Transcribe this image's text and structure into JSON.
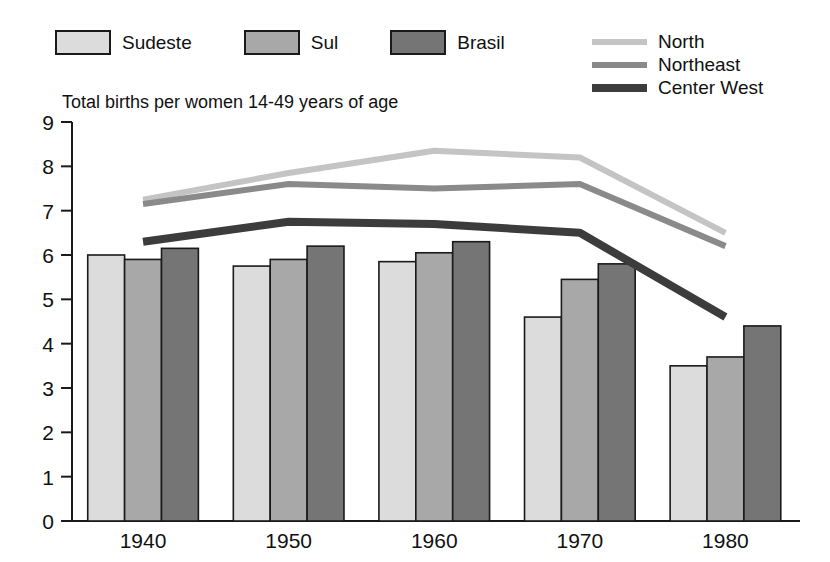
{
  "chart_data": {
    "type": "bar",
    "title": "Total births per women 14-49 years of age",
    "xlabel": "",
    "ylabel": "",
    "ylim": [
      0,
      9
    ],
    "ytick_values": [
      0,
      1,
      2,
      3,
      4,
      5,
      6,
      7,
      8,
      9
    ],
    "ytick_labels": [
      "0",
      "1",
      "2",
      "3",
      "4",
      "5",
      "6",
      "7",
      "8",
      "9"
    ],
    "grid": false,
    "legend_position": "top",
    "categories": [
      "1940",
      "1950",
      "1960",
      "1970",
      "1980"
    ],
    "bar_series": [
      {
        "name": "Sudeste",
        "color": "#dcdcdc",
        "values": [
          6.0,
          5.75,
          5.85,
          4.6,
          3.5
        ]
      },
      {
        "name": "Sul",
        "color": "#a8a8a8",
        "values": [
          5.9,
          5.9,
          6.05,
          5.45,
          3.7
        ]
      },
      {
        "name": "Brasil",
        "color": "#757575",
        "values": [
          6.15,
          6.2,
          6.3,
          5.8,
          4.4
        ]
      }
    ],
    "line_series": [
      {
        "name": "North",
        "color": "#c4c4c4",
        "width": 6,
        "values": [
          7.25,
          7.85,
          8.35,
          8.2,
          6.5
        ]
      },
      {
        "name": "Northeast",
        "color": "#8a8a8a",
        "width": 6,
        "values": [
          7.15,
          7.6,
          7.5,
          7.6,
          6.2
        ]
      },
      {
        "name": "Center West",
        "color": "#3c3c3c",
        "width": 8,
        "values": [
          6.3,
          6.75,
          6.7,
          6.5,
          4.6
        ]
      }
    ]
  },
  "legend": {
    "bars": [
      {
        "label": "Sudeste",
        "color": "#dcdcdc"
      },
      {
        "label": "Sul",
        "color": "#a8a8a8"
      },
      {
        "label": "Brasil",
        "color": "#757575"
      }
    ],
    "lines": [
      {
        "label": "North",
        "color": "#c4c4c4"
      },
      {
        "label": "Northeast",
        "color": "#8a8a8a"
      },
      {
        "label": "Center West",
        "color": "#3c3c3c"
      }
    ]
  }
}
